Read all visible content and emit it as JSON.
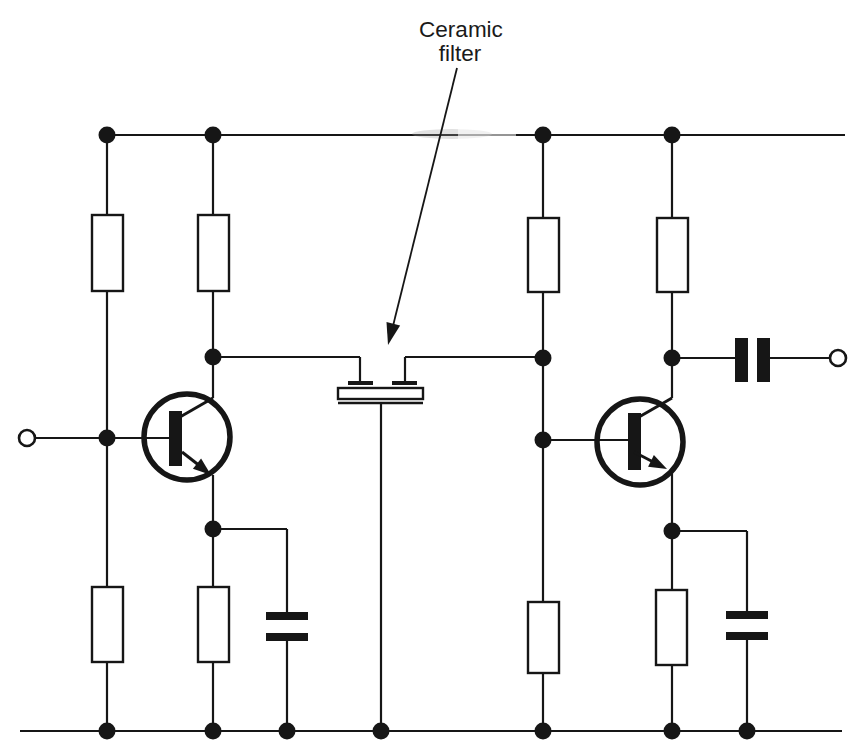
{
  "label": {
    "line1": "Ceramic",
    "line2": "filter"
  },
  "colors": {
    "ink": "#161616",
    "background": "#ffffff"
  },
  "schematic": {
    "type": "circuit-diagram",
    "subject": "two-stage NPN transistor amplifier coupled through a ceramic filter",
    "components": [
      {
        "name": "supply-rail",
        "kind": "wire-rail"
      },
      {
        "name": "ground-rail",
        "kind": "wire-rail"
      },
      {
        "name": "input-terminal",
        "kind": "open-circle-terminal"
      },
      {
        "name": "output-terminal",
        "kind": "open-circle-terminal"
      },
      {
        "name": "bias-resistor-upper-left",
        "kind": "resistor"
      },
      {
        "name": "bias-resistor-lower-left",
        "kind": "resistor"
      },
      {
        "name": "collector-resistor-left",
        "kind": "resistor"
      },
      {
        "name": "emitter-resistor-left",
        "kind": "resistor"
      },
      {
        "name": "bias-resistor-upper-right",
        "kind": "resistor"
      },
      {
        "name": "bias-resistor-lower-right",
        "kind": "resistor"
      },
      {
        "name": "collector-resistor-right",
        "kind": "resistor"
      },
      {
        "name": "emitter-resistor-right",
        "kind": "resistor"
      },
      {
        "name": "transistor-left",
        "kind": "npn-transistor"
      },
      {
        "name": "transistor-right",
        "kind": "npn-transistor"
      },
      {
        "name": "emitter-bypass-capacitor-left",
        "kind": "capacitor"
      },
      {
        "name": "emitter-bypass-capacitor-right",
        "kind": "capacitor"
      },
      {
        "name": "output-coupling-capacitor",
        "kind": "capacitor"
      },
      {
        "name": "ceramic-filter",
        "kind": "ceramic-filter",
        "label": "Ceramic filter"
      }
    ]
  }
}
